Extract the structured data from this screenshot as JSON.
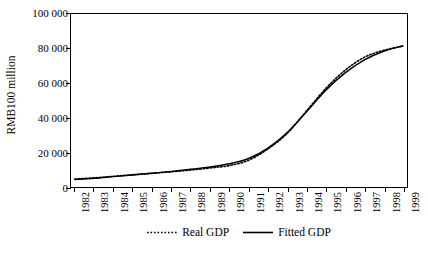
{
  "chart_data": {
    "type": "line",
    "title": "",
    "xlabel": "",
    "ylabel": "RMB100 million",
    "ylim": [
      0,
      100000
    ],
    "yticks": [
      0,
      20000,
      40000,
      60000,
      80000,
      100000
    ],
    "ytick_labels": [
      "0",
      "20 000",
      "40 000",
      "60 000",
      "80 000",
      "100 000"
    ],
    "grid": false,
    "legend_position": "bottom-center",
    "categories": [
      "1982",
      "1983",
      "1984",
      "1985",
      "1986",
      "1987",
      "1988",
      "1989",
      "1990",
      "1991",
      "1992",
      "1993",
      "1994",
      "1995",
      "1996",
      "1997",
      "1998",
      "1999"
    ],
    "series": [
      {
        "name": "Real GDP",
        "style": "dotted",
        "color": "#000000",
        "values": [
          4600,
          5300,
          6200,
          7100,
          7900,
          8800,
          9800,
          11000,
          12400,
          15500,
          22000,
          31000,
          44000,
          57000,
          67500,
          75000,
          79000,
          81500
        ]
      },
      {
        "name": "Fitted GDP",
        "style": "solid",
        "color": "#000000",
        "values": [
          4300,
          5000,
          6000,
          7000,
          8000,
          9000,
          10200,
          11600,
          13400,
          16500,
          22500,
          31500,
          43500,
          56000,
          66000,
          73500,
          78500,
          81500
        ]
      }
    ]
  },
  "axis": {
    "y_title": "RMB100 million"
  },
  "legend": {
    "items": [
      {
        "label": "Real GDP",
        "style": "dotted"
      },
      {
        "label": "Fitted GDP",
        "style": "solid"
      }
    ]
  }
}
